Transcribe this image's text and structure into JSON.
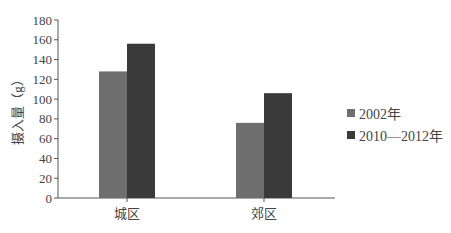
{
  "chart_data": {
    "type": "bar",
    "title": "",
    "xlabel": "",
    "ylabel": "摄入量（g）",
    "categories": [
      "城区",
      "郊区"
    ],
    "series": [
      {
        "name": "2002年",
        "values": [
          128,
          76
        ],
        "color": "#6e6e6e"
      },
      {
        "name": "2010—2012年",
        "values": [
          156,
          106
        ],
        "color": "#3a3a3a"
      }
    ],
    "ylim": [
      0,
      180
    ],
    "yticks": [
      0,
      20,
      40,
      60,
      80,
      100,
      120,
      140,
      160,
      180
    ],
    "grid": false,
    "legend_position": "right"
  }
}
